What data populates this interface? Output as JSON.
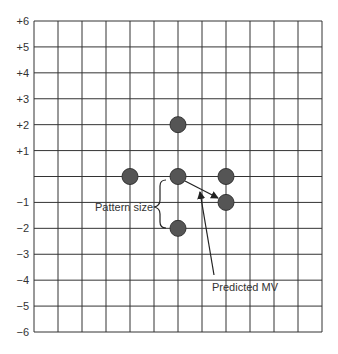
{
  "diagram": {
    "type": "motion-vector-search-pattern",
    "grid": {
      "columns": 12,
      "rows": 12,
      "x_left": 34,
      "x_right": 322,
      "y_top": 21,
      "y_bottom": 332,
      "line_color": "#333333"
    },
    "y_axis_labels": [
      {
        "text": "+6",
        "value": 6
      },
      {
        "text": "+5",
        "value": 5
      },
      {
        "text": "+4",
        "value": 4
      },
      {
        "text": "+3",
        "value": 3
      },
      {
        "text": "+2",
        "value": 2
      },
      {
        "text": "+1",
        "value": 1
      },
      {
        "text": "−1",
        "value": -1
      },
      {
        "text": "−2",
        "value": -2
      },
      {
        "text": "−3",
        "value": -3
      },
      {
        "text": "−4",
        "value": -4
      },
      {
        "text": "−5",
        "value": -5
      },
      {
        "text": "−6",
        "value": -6
      }
    ],
    "search_points": [
      {
        "col": 6,
        "row": 4
      },
      {
        "col": 4,
        "row": 6
      },
      {
        "col": 6,
        "row": 6
      },
      {
        "col": 8,
        "row": 6
      },
      {
        "col": 8,
        "row": 7
      },
      {
        "col": 6,
        "row": 8
      }
    ],
    "point_style": {
      "fill": "#555555",
      "stroke": "#333333",
      "radius": 8
    },
    "annotations": {
      "pattern_size": "Pattern size",
      "predicted_mv": "Predicted MV"
    }
  }
}
